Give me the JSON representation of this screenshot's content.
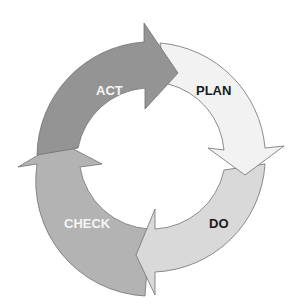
{
  "diagram": {
    "type": "cycle",
    "stages": [
      {
        "id": "plan",
        "label": "PLAN",
        "fill": "#f2f2f2",
        "text_color": "#1a1a1a"
      },
      {
        "id": "do",
        "label": "DO",
        "fill": "#d9d9d9",
        "text_color": "#1a1a1a"
      },
      {
        "id": "check",
        "label": "CHECK",
        "fill": "#b3b3b3",
        "text_color": "#f5f5f5"
      },
      {
        "id": "act",
        "label": "ACT",
        "fill": "#949494",
        "text_color": "#f5f5f5"
      }
    ],
    "stroke": "#707070",
    "direction": "clockwise"
  }
}
